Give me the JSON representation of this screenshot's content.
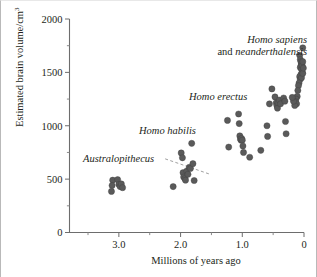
{
  "figure": {
    "background": "#ffffff",
    "frame_color": "#b9b9b9"
  },
  "axes": {
    "y": {
      "label_main": "Estimated brain volume/cm",
      "label_sup": "3",
      "ticks": [
        "2000",
        "1500",
        "1000",
        "500",
        "0"
      ],
      "tick_values": [
        2000,
        1500,
        1000,
        500,
        0
      ],
      "minor_tick_values": [
        1750,
        1250,
        750,
        250
      ],
      "range": [
        0,
        2000
      ]
    },
    "x": {
      "label": "Millions of years ago",
      "ticks": [
        "3.0",
        "2.0",
        "1.0",
        "0"
      ],
      "tick_values": [
        3.0,
        2.0,
        1.0,
        0
      ],
      "minor_tick_values": [
        3.5,
        2.5,
        1.5,
        0.5
      ],
      "range": [
        3.8,
        0
      ],
      "reversed": true
    },
    "axis_color": "#6d6d6d"
  },
  "annotations": {
    "australopithecus": "Australopithecus",
    "homo_habilis": "Homo habilis",
    "homo_erectus": "Homo erectus",
    "homo_sapiens_line1": "Homo sapiens",
    "homo_sapiens_line2_roman": "and ",
    "homo_sapiens_line2_italic": "neanderthalensis"
  },
  "marker": {
    "color": "#5a5a5a",
    "radius": 3.1,
    "shape": "circle"
  },
  "trend_line": {
    "style": "dashed",
    "color": "#a0a0a0",
    "x_start": 2.25,
    "y_start": 690,
    "x_end": 1.52,
    "y_end": 545
  },
  "chart_data": {
    "type": "scatter",
    "title": "",
    "xlabel": "Millions of years ago",
    "ylabel": "Estimated brain volume/cm3",
    "xlim": [
      3.8,
      0
    ],
    "ylim": [
      0,
      2000
    ],
    "x_reversed": true,
    "grid": false,
    "legend": "none",
    "series": [
      {
        "name": "Australopithecus",
        "points": [
          [
            3.1,
            490
          ],
          [
            3.11,
            440
          ],
          [
            3.12,
            385
          ],
          [
            3.02,
            495
          ],
          [
            3.0,
            450
          ],
          [
            2.98,
            430
          ],
          [
            2.96,
            455
          ],
          [
            2.94,
            420
          ]
        ]
      },
      {
        "name": "Homo habilis",
        "points": [
          [
            2.12,
            430
          ],
          [
            1.99,
            745
          ],
          [
            1.97,
            700
          ],
          [
            1.96,
            560
          ],
          [
            1.95,
            520
          ],
          [
            1.93,
            505
          ],
          [
            1.92,
            490
          ],
          [
            1.9,
            575
          ],
          [
            1.88,
            545
          ],
          [
            1.86,
            610
          ],
          [
            1.84,
            600
          ],
          [
            1.82,
            835
          ],
          [
            1.8,
            645
          ],
          [
            1.78,
            487
          ]
        ]
      },
      {
        "name": "Homo erectus",
        "points": [
          [
            1.24,
            1050
          ],
          [
            1.06,
            1110
          ],
          [
            1.05,
            1020
          ],
          [
            1.04,
            905
          ],
          [
            1.03,
            875
          ],
          [
            1.02,
            865
          ],
          [
            1.01,
            880
          ],
          [
            1.0,
            865
          ],
          [
            0.99,
            810
          ],
          [
            0.98,
            750
          ],
          [
            1.22,
            800
          ],
          [
            0.88,
            705
          ],
          [
            0.7,
            770
          ],
          [
            0.6,
            1000
          ],
          [
            0.59,
            900
          ],
          [
            0.56,
            1205
          ],
          [
            0.52,
            1345
          ],
          [
            0.47,
            1270
          ],
          [
            0.45,
            1215
          ],
          [
            0.44,
            1190
          ],
          [
            0.43,
            1165
          ],
          [
            0.42,
            1215
          ],
          [
            0.4,
            1240
          ],
          [
            0.38,
            1205
          ],
          [
            0.33,
            1260
          ],
          [
            0.31,
            1230
          ],
          [
            0.3,
            1040
          ],
          [
            0.29,
            925
          ]
        ]
      },
      {
        "name": "Homo sapiens and neanderthalensis",
        "points": [
          [
            0.02,
            1730
          ],
          [
            0.07,
            1660
          ],
          [
            0.06,
            1620
          ],
          [
            0.05,
            1600
          ],
          [
            0.04,
            1585
          ],
          [
            0.05,
            1560
          ],
          [
            0.06,
            1545
          ],
          [
            0.04,
            1530
          ],
          [
            0.03,
            1565
          ],
          [
            0.02,
            1600
          ],
          [
            0.03,
            1500
          ],
          [
            0.05,
            1480
          ],
          [
            0.07,
            1460
          ],
          [
            0.06,
            1435
          ],
          [
            0.04,
            1450
          ],
          [
            0.02,
            1490
          ],
          [
            0.01,
            1540
          ],
          [
            0.08,
            1400
          ],
          [
            0.09,
            1375
          ],
          [
            0.1,
            1330
          ],
          [
            0.11,
            1275
          ],
          [
            0.13,
            1250
          ],
          [
            0.14,
            1225
          ],
          [
            0.12,
            1205
          ],
          [
            0.15,
            1190
          ],
          [
            0.17,
            1230
          ],
          [
            0.19,
            1265
          ]
        ]
      }
    ]
  }
}
